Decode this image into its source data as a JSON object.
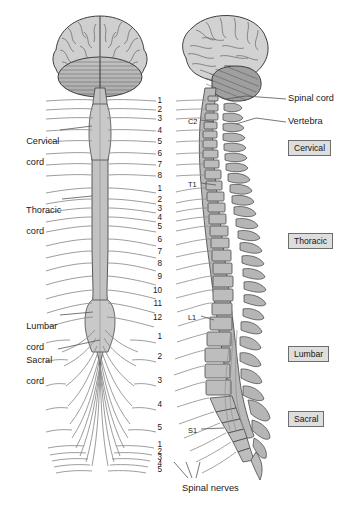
{
  "figure": {
    "caption_bottom": ""
  },
  "colors": {
    "tissue_fill": "#c9c9c9",
    "bone_fill": "#bdbdbd",
    "outline": "#4a4a4a",
    "nerve_line": "#8a8a8a",
    "leader_line": "#555555",
    "box_fill": "#dedede",
    "box_border": "#6d6d6d",
    "text": "#1a1a1a"
  },
  "left_labels": [
    {
      "id": "cervical-cord",
      "line1": "Cervical",
      "line2": "cord",
      "x": 16,
      "y": 126
    },
    {
      "id": "thoracic-cord",
      "line1": "Thoracic",
      "line2": "cord",
      "x": 16,
      "y": 195
    },
    {
      "id": "lumbar-cord",
      "line1": "Lumbar",
      "line2": "cord",
      "x": 16,
      "y": 311
    },
    {
      "id": "sacral-cord",
      "line1": "Sacral",
      "line2": "cord",
      "x": 16,
      "y": 345
    }
  ],
  "right_labels": [
    {
      "id": "spinal-cord",
      "text": "Spinal cord",
      "x": 288,
      "y": 97
    },
    {
      "id": "vertebra",
      "text": "Vertebra",
      "x": 288,
      "y": 120
    }
  ],
  "vertebra_markers": [
    {
      "id": "c2",
      "text": "C2",
      "x": 188,
      "y": 118
    },
    {
      "id": "t1",
      "text": "T1",
      "x": 188,
      "y": 180
    },
    {
      "id": "l1",
      "text": "L1",
      "x": 188,
      "y": 313
    },
    {
      "id": "s1",
      "text": "S1",
      "x": 188,
      "y": 426
    }
  ],
  "region_boxes": [
    {
      "id": "cervical",
      "label": "Cervical",
      "x": 288,
      "y": 143
    },
    {
      "id": "thoracic",
      "label": "Thoracic",
      "x": 288,
      "y": 236
    },
    {
      "id": "lumbar",
      "label": "Lumbar",
      "x": 288,
      "y": 349
    },
    {
      "id": "sacral",
      "label": "Sacral",
      "x": 288,
      "y": 414
    }
  ],
  "nerve_groups": [
    {
      "id": "cervical-nerves",
      "region": "Cervical",
      "count": 8,
      "numbers": [
        {
          "n": "1",
          "y": 101
        },
        {
          "n": "2",
          "y": 110
        },
        {
          "n": "3",
          "y": 119
        },
        {
          "n": "4",
          "y": 131
        },
        {
          "n": "5",
          "y": 142
        },
        {
          "n": "6",
          "y": 154
        },
        {
          "n": "7",
          "y": 165
        },
        {
          "n": "8",
          "y": 176
        }
      ]
    },
    {
      "id": "thoracic-nerves",
      "region": "Thoracic",
      "count": 12,
      "numbers": [
        {
          "n": "1",
          "y": 189
        },
        {
          "n": "2",
          "y": 200
        },
        {
          "n": "3",
          "y": 209
        },
        {
          "n": "4",
          "y": 218
        },
        {
          "n": "5",
          "y": 227
        },
        {
          "n": "6",
          "y": 240
        },
        {
          "n": "7",
          "y": 252
        },
        {
          "n": "8",
          "y": 264
        },
        {
          "n": "9",
          "y": 277
        },
        {
          "n": "10",
          "y": 291
        },
        {
          "n": "11",
          "y": 304
        },
        {
          "n": "12",
          "y": 318
        }
      ]
    },
    {
      "id": "lumbar-nerves",
      "region": "Lumbar",
      "count": 5,
      "numbers": [
        {
          "n": "1",
          "y": 337
        },
        {
          "n": "2",
          "y": 357
        },
        {
          "n": "3",
          "y": 381
        },
        {
          "n": "4",
          "y": 405
        },
        {
          "n": "5",
          "y": 428
        }
      ]
    },
    {
      "id": "sacral-nerves",
      "region": "Sacral",
      "count": 5,
      "numbers": [
        {
          "n": "1",
          "y": 445
        },
        {
          "n": "2",
          "y": 452
        },
        {
          "n": "3",
          "y": 458
        },
        {
          "n": "4",
          "y": 464
        },
        {
          "n": "5",
          "y": 470
        }
      ]
    }
  ],
  "bottom_label": {
    "id": "spinal-nerves",
    "text": "Spinal nerves",
    "x": 182,
    "y": 487
  },
  "anatomy_parts": [
    "brain-posterior-view",
    "cerebellum-posterior",
    "brain-lateral-view",
    "cerebellum-lateral",
    "spinal-cord-anterior",
    "spinal-cord-lateral",
    "vertebral-column",
    "cauda-equina",
    "spinal-nerve-roots"
  ]
}
